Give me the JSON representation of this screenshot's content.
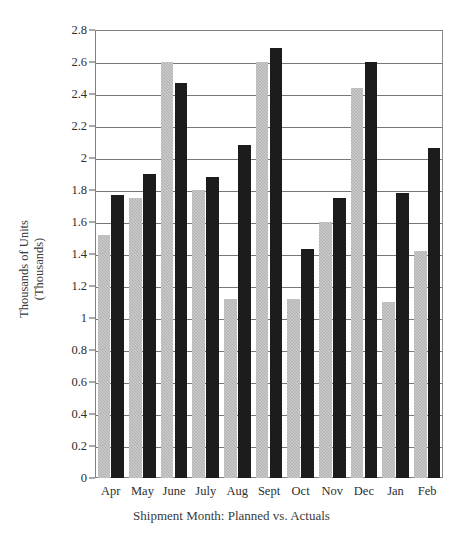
{
  "chart_data": {
    "type": "bar",
    "title": "",
    "subtitle": "",
    "xlabel": "Shipment Month: Planned vs. Actuals",
    "ylabel": "Thousands of Units\n(Thousands)",
    "categories": [
      "Apr",
      "May",
      "June",
      "July",
      "Aug",
      "Sept",
      "Oct",
      "Nov",
      "Dec",
      "Jan",
      "Feb"
    ],
    "series": [
      {
        "name": "Planned",
        "color": "#b2b2b2",
        "values": [
          1.52,
          1.75,
          2.6,
          1.8,
          1.12,
          2.6,
          1.12,
          1.6,
          2.44,
          1.1,
          1.42
        ]
      },
      {
        "name": "Actuals",
        "color": "#1c1c1c",
        "values": [
          1.77,
          1.9,
          2.47,
          1.88,
          2.08,
          2.69,
          1.43,
          1.75,
          2.6,
          1.78,
          2.06
        ]
      }
    ],
    "ylim": [
      0,
      2.8
    ],
    "ytick_values": [
      0,
      0.2,
      0.4,
      0.6,
      0.8,
      1,
      1.2,
      1.4,
      1.6,
      1.8,
      2,
      2.2,
      2.4,
      2.6,
      2.8
    ],
    "ytick_labels": [
      "0",
      "0.2",
      "0.4",
      "0.6",
      "0.8",
      "1",
      "1.2",
      "1.4",
      "1.6",
      "1.8",
      "2",
      "2.2",
      "2.4",
      "2.6",
      "2.8"
    ],
    "grid": true,
    "grid_axis": "y",
    "legend": false,
    "legend_position": "none"
  }
}
